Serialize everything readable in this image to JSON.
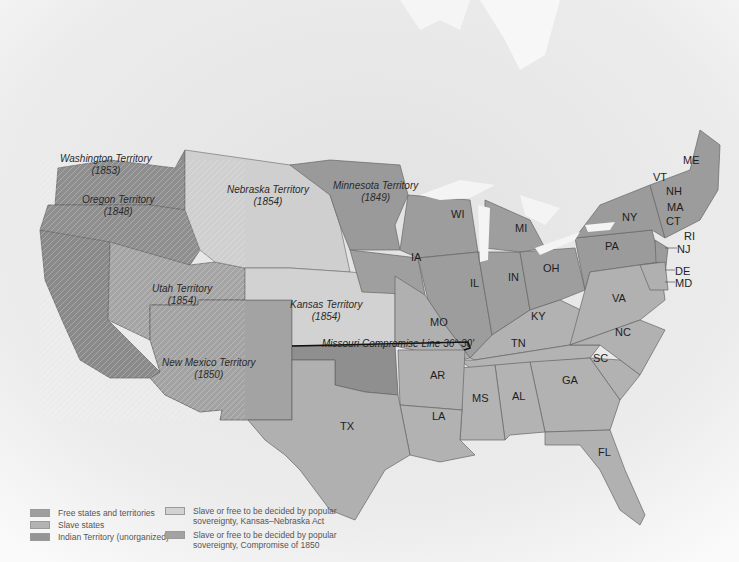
{
  "map": {
    "colors": {
      "free": "#9e9e9e",
      "slave": "#b0b0b0",
      "indian": "#999999",
      "kansas_nebraska": "#cfcfcf",
      "compromise_1850": "#a6a6a6",
      "canada": "#e6e6e6",
      "water": "#f6f6f6",
      "border": "#6f6f6f"
    },
    "territories": [
      {
        "name": "Washington Territory",
        "year": "(1853)"
      },
      {
        "name": "Oregon Territory",
        "year": "(1848)"
      },
      {
        "name": "Nebraska Territory",
        "year": "(1854)"
      },
      {
        "name": "Minnesota Territory",
        "year": "(1849)"
      },
      {
        "name": "Utah Territory",
        "year": "(1854)"
      },
      {
        "name": "Kansas Territory",
        "year": "(1854)"
      },
      {
        "name": "New Mexico Territory",
        "year": "(1850)"
      }
    ],
    "states": {
      "ME": "ME",
      "VT": "VT",
      "NH": "NH",
      "MA": "MA",
      "CT": "CT",
      "RI": "RI",
      "NY": "NY",
      "NJ": "NJ",
      "PA": "PA",
      "DE": "DE",
      "MD": "MD",
      "WI": "WI",
      "MI": "MI",
      "IA": "IA",
      "IL": "IL",
      "IN": "IN",
      "OH": "OH",
      "MO": "MO",
      "KY": "KY",
      "VA": "VA",
      "NC": "NC",
      "TN": "TN",
      "SC": "SC",
      "AR": "AR",
      "GA": "GA",
      "MS": "MS",
      "AL": "AL",
      "LA": "LA",
      "TX": "TX",
      "FL": "FL"
    },
    "missouri_line": "Missouri Compromise Line 36° 30′"
  },
  "legend": {
    "items": [
      {
        "label": "Free states and territories",
        "color": "#9e9e9e"
      },
      {
        "label": "Slave states",
        "color": "#b3b3b3"
      },
      {
        "label": "Indian Territory (unorganized)",
        "color": "#959595"
      },
      {
        "label": "Slave or free to be decided by popular",
        "label2": "sovereignty, Kansas–Nebraska Act",
        "color": "#d2d2d2"
      },
      {
        "label": "Slave or free to be decided by popular",
        "label2": "sovereignty, Compromise of 1850",
        "color": "#a2a2a2"
      }
    ]
  }
}
